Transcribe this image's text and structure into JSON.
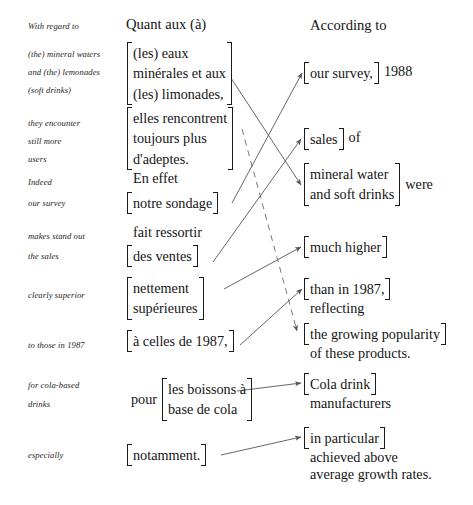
{
  "document": {
    "type": "interlinear-translation-diagram",
    "headers": {
      "source_gloss": "With regard to",
      "french": "Quant aux (à)",
      "english": "According to"
    },
    "colors": {
      "text": "#141414",
      "gloss_text": "#242424",
      "connector": "#555555",
      "background": "#ffffff"
    }
  },
  "gloss_column": [
    {
      "id": "g1",
      "lines": [
        "With regard to"
      ]
    },
    {
      "id": "g2",
      "lines": [
        "(the) mineral waters",
        "and (the) lemonades",
        "(soft drinks)"
      ]
    },
    {
      "id": "g3",
      "lines": [
        "they encounter",
        "still more",
        "users"
      ]
    },
    {
      "id": "g4",
      "lines": [
        "Indeed",
        "our survey"
      ]
    },
    {
      "id": "g5",
      "lines": [
        "makes stand out",
        "the sales"
      ]
    },
    {
      "id": "g6",
      "lines": [
        "clearly superior"
      ]
    },
    {
      "id": "g7",
      "lines": [
        "to those in 1987"
      ]
    },
    {
      "id": "g8",
      "lines": [
        "for cola-based",
        "drinks"
      ]
    },
    {
      "id": "g9",
      "lines": [
        "especially"
      ]
    }
  ],
  "french_column": {
    "header": "Quant aux (à)",
    "groups": [
      {
        "id": "f1",
        "bracket": true,
        "lines": [
          "(les) eaux",
          "minérales et aux",
          "(les) limonades,"
        ]
      },
      {
        "id": "f2",
        "bracket": true,
        "lines": [
          "elles rencontrent",
          "toujours plus",
          "d'adeptes."
        ]
      },
      {
        "id": "f3",
        "bracket": false,
        "lines": [
          "En effet"
        ]
      },
      {
        "id": "f4",
        "bracket": true,
        "lines": [
          "notre sondage"
        ]
      },
      {
        "id": "f5",
        "bracket": false,
        "lines": [
          "fait ressortir"
        ]
      },
      {
        "id": "f6",
        "bracket": true,
        "lines": [
          "des ventes"
        ]
      },
      {
        "id": "f7",
        "bracket": true,
        "lines": [
          "nettement",
          "supérieures"
        ]
      },
      {
        "id": "f8",
        "bracket": true,
        "lines": [
          "à celles de 1987,"
        ]
      },
      {
        "id": "f9",
        "bracket": true,
        "prefix": "pour",
        "lines": [
          "les boissons à",
          "base de cola"
        ]
      },
      {
        "id": "f10",
        "bracket": true,
        "lines": [
          "notamment."
        ]
      }
    ]
  },
  "english_column": {
    "header": "According to",
    "groups": [
      {
        "id": "e1",
        "bracket": true,
        "lines": [
          "our survey,"
        ],
        "suffix": "1988"
      },
      {
        "id": "e2",
        "bracket": true,
        "lines": [
          "sales"
        ],
        "suffix": "of"
      },
      {
        "id": "e3",
        "bracket": true,
        "lines": [
          "mineral water",
          "and soft drinks"
        ],
        "suffix": "were"
      },
      {
        "id": "e4",
        "bracket": true,
        "lines": [
          "much higher"
        ]
      },
      {
        "id": "e5",
        "bracket": true,
        "lines": [
          "than in 1987,"
        ],
        "below": "reflecting"
      },
      {
        "id": "e6",
        "bracket": true,
        "lines": [
          "the growing popularity"
        ],
        "below": "of these products."
      },
      {
        "id": "e7",
        "bracket": true,
        "lines": [
          "Cola drink"
        ],
        "below": "manufacturers"
      },
      {
        "id": "e8",
        "bracket": true,
        "lines": [
          "in particular"
        ],
        "below_1": "achieved above",
        "below_2": "average growth rates."
      }
    ]
  },
  "connectors": [
    {
      "id": "c1",
      "from": "f1",
      "to": "e3",
      "style": "solid",
      "arrow": true
    },
    {
      "id": "c2",
      "from": "f4",
      "to": "e1",
      "style": "solid",
      "arrow": true
    },
    {
      "id": "c3",
      "from": "f6",
      "to": "e2",
      "style": "solid",
      "arrow": true
    },
    {
      "id": "c4",
      "from": "f7",
      "to": "e4",
      "style": "solid",
      "arrow": true
    },
    {
      "id": "c5",
      "from": "f8",
      "to": "e5",
      "style": "solid",
      "arrow": true
    },
    {
      "id": "c6",
      "from": "f2",
      "to": "e6",
      "style": "dashed",
      "arrow": true
    },
    {
      "id": "c7",
      "from": "f9",
      "to": "e7",
      "style": "solid",
      "arrow": true
    },
    {
      "id": "c8",
      "from": "f10",
      "to": "e8",
      "style": "solid",
      "arrow": true
    }
  ]
}
